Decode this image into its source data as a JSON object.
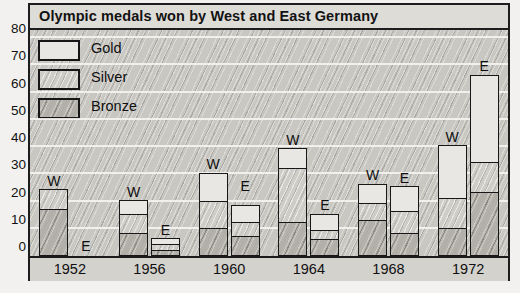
{
  "chart_data": {
    "type": "bar",
    "subtype": "stacked-grouped-bar",
    "title": "Olympic medals won by West and East Germany",
    "xlabel": "",
    "ylabel": "",
    "ylim": [
      0,
      80
    ],
    "yticks": [
      0,
      10,
      20,
      30,
      40,
      50,
      60,
      70,
      80
    ],
    "ytick_labels": [
      "0",
      "10",
      "20",
      "30",
      "40",
      "50",
      "60",
      "70",
      "80"
    ],
    "grid": true,
    "grid_axis": "y",
    "legend_position": "upper-left",
    "categories": [
      "1952",
      "1956",
      "1960",
      "1964",
      "1968",
      "1972"
    ],
    "group_labels": [
      "W",
      "E"
    ],
    "group_names": [
      "West Germany",
      "East Germany"
    ],
    "legend": [
      "Gold",
      "Silver",
      "Bronze"
    ],
    "series": [
      {
        "name": "Bronze",
        "values_west": [
          17,
          8,
          10,
          12,
          13,
          10
        ],
        "values_east": [
          0,
          2,
          7,
          6,
          8,
          23
        ]
      },
      {
        "name": "Silver",
        "values_west": [
          7,
          7,
          10,
          20,
          6,
          11
        ],
        "values_east": [
          0,
          2,
          5,
          3,
          8,
          11
        ]
      },
      {
        "name": "Gold",
        "values_west": [
          0,
          5,
          10,
          7,
          7,
          19
        ],
        "values_east": [
          0,
          2,
          6,
          6,
          9,
          32
        ]
      }
    ],
    "totals_west": [
      24,
      20,
      30,
      39,
      26,
      40
    ],
    "totals_east": [
      0,
      6,
      22,
      15,
      25,
      66
    ],
    "bar_labels": [
      {
        "year": "1952",
        "team": "W",
        "total": 24
      },
      {
        "year": "1952",
        "team": "E",
        "total": 0
      },
      {
        "year": "1956",
        "team": "W",
        "total": 20
      },
      {
        "year": "1956",
        "team": "E",
        "total": 6
      },
      {
        "year": "1960",
        "team": "W",
        "total": 30
      },
      {
        "year": "1960",
        "team": "E",
        "total": 22
      },
      {
        "year": "1964",
        "team": "W",
        "total": 39
      },
      {
        "year": "1964",
        "team": "E",
        "total": 15
      },
      {
        "year": "1968",
        "team": "W",
        "total": 26
      },
      {
        "year": "1968",
        "team": "E",
        "total": 25
      },
      {
        "year": "1972",
        "team": "W",
        "total": 40
      },
      {
        "year": "1972",
        "team": "E",
        "total": 66
      }
    ],
    "colors": {
      "gold_fill": "#e8e7e4",
      "silver_fill": "#cfcdc8",
      "bronze_fill": "#b4b1ab",
      "plot_background": "#c9c7c2",
      "frame": "#1d1d1d",
      "gridline": "#f4f3f1",
      "text": "#111111"
    }
  },
  "axis": {
    "y_labels": [
      "80",
      "70",
      "60",
      "50",
      "40",
      "30",
      "20",
      "10",
      "0"
    ],
    "x_labels": [
      "1952",
      "1956",
      "1960",
      "1964",
      "1968",
      "1972"
    ]
  },
  "legend": {
    "items": [
      {
        "label": "Gold",
        "swatch": "gold-swatch"
      },
      {
        "label": "Silver",
        "swatch": "silver-swatch"
      },
      {
        "label": "Bronze",
        "swatch": "bronze-swatch"
      }
    ]
  },
  "header": {
    "title": "Olympic medals won by West and East Germany"
  }
}
